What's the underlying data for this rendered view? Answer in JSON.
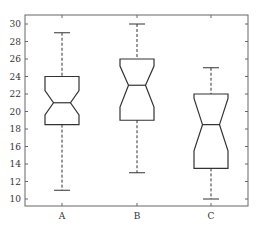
{
  "chart_data": {
    "type": "boxplot",
    "title": "",
    "xlabel": "",
    "ylabel": "",
    "notched": true,
    "categories": [
      "A",
      "B",
      "C"
    ],
    "ylim": [
      9,
      31
    ],
    "yticks": [
      10,
      12,
      14,
      16,
      18,
      20,
      22,
      24,
      26,
      28,
      30
    ],
    "grid": false,
    "series": [
      {
        "name": "A",
        "whisker_low": 11,
        "q1": 18.5,
        "median": 21,
        "q3": 24,
        "whisker_high": 29,
        "notch_low": 19.6,
        "notch_high": 22.4
      },
      {
        "name": "B",
        "whisker_low": 13,
        "q1": 19,
        "median": 23,
        "q3": 26,
        "whisker_high": 30,
        "notch_low": 20.5,
        "notch_high": 25.2
      },
      {
        "name": "C",
        "whisker_low": 10,
        "q1": 13.5,
        "median": 18.5,
        "q3": 22,
        "whisker_high": 25,
        "notch_low": 15.5,
        "notch_high": 21.5
      }
    ]
  },
  "colors": {
    "box": "#333333",
    "axis": "#555555",
    "text": "#333333"
  }
}
